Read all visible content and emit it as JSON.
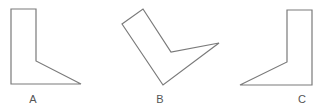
{
  "figure": {
    "stroke_color": "#7a7a7a",
    "shapes": [
      {
        "label": "A",
        "points": "11,9 36,9 36,61 81,84 11,84",
        "label_x": 33,
        "label_y": 93
      },
      {
        "label": "B",
        "points": "122,24 143,9 171,52 219,43 163,85",
        "label_x": 160,
        "label_y": 93
      },
      {
        "label": "C",
        "points": "287,10 312,10 312,85 240,85 287,62",
        "label_x": 302,
        "label_y": 93
      }
    ]
  }
}
